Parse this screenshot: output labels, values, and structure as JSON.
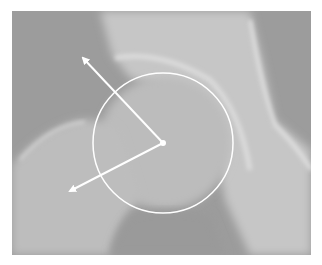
{
  "figure": {
    "colors": {
      "background": "#ffffff",
      "film_base": "#9a9a9a",
      "bone_light": "#c8c8c8",
      "overlay": "#ffffff"
    },
    "overlay": {
      "circle": {
        "cx": 163,
        "cy": 143,
        "r": 70
      },
      "center_dot": {
        "cx": 163,
        "cy": 143
      },
      "arrows": [
        {
          "name": "upper-arrow",
          "from": [
            163,
            143
          ],
          "to": [
            83,
            58
          ]
        },
        {
          "name": "lower-arrow",
          "from": [
            163,
            143
          ],
          "to": [
            70,
            191
          ]
        }
      ]
    }
  }
}
